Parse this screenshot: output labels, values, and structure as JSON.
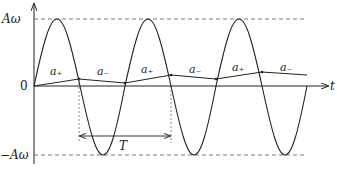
{
  "figure": {
    "y_labels": {
      "top": "Aω",
      "zero": "0",
      "bottom": "−Aω"
    },
    "x_axis_label": "t",
    "period_label": "T",
    "segment_labels": [
      "a₊",
      "a₋",
      "a₊",
      "a₋",
      "a₊",
      "a₋"
    ],
    "line_color": "#222222",
    "dash_color": "#555555"
  }
}
